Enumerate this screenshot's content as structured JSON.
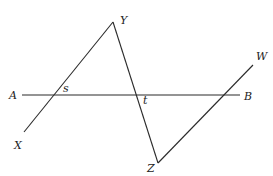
{
  "diagram": {
    "type": "geometry",
    "lines": [
      {
        "name": "line-AB",
        "from": "A",
        "to": "B",
        "x1": 22,
        "y1": 95,
        "x2": 240,
        "y2": 95
      },
      {
        "name": "segment-XY",
        "from": "X",
        "to": "Y",
        "x1": 24,
        "y1": 132,
        "x2": 113,
        "y2": 22
      },
      {
        "name": "segment-YZ",
        "from": "Y",
        "to": "Z",
        "x1": 113,
        "y1": 22,
        "x2": 158,
        "y2": 163
      },
      {
        "name": "segment-ZW",
        "from": "Z",
        "to": "W",
        "x1": 158,
        "y1": 163,
        "x2": 253,
        "y2": 65
      }
    ],
    "labels": {
      "A": "A",
      "B": "B",
      "X": "X",
      "Y": "Y",
      "Z": "Z",
      "W": "W",
      "s": "s",
      "t": "t"
    },
    "colors": {
      "line": "#2a2a2a",
      "text": "#222222",
      "background": "#ffffff"
    }
  }
}
